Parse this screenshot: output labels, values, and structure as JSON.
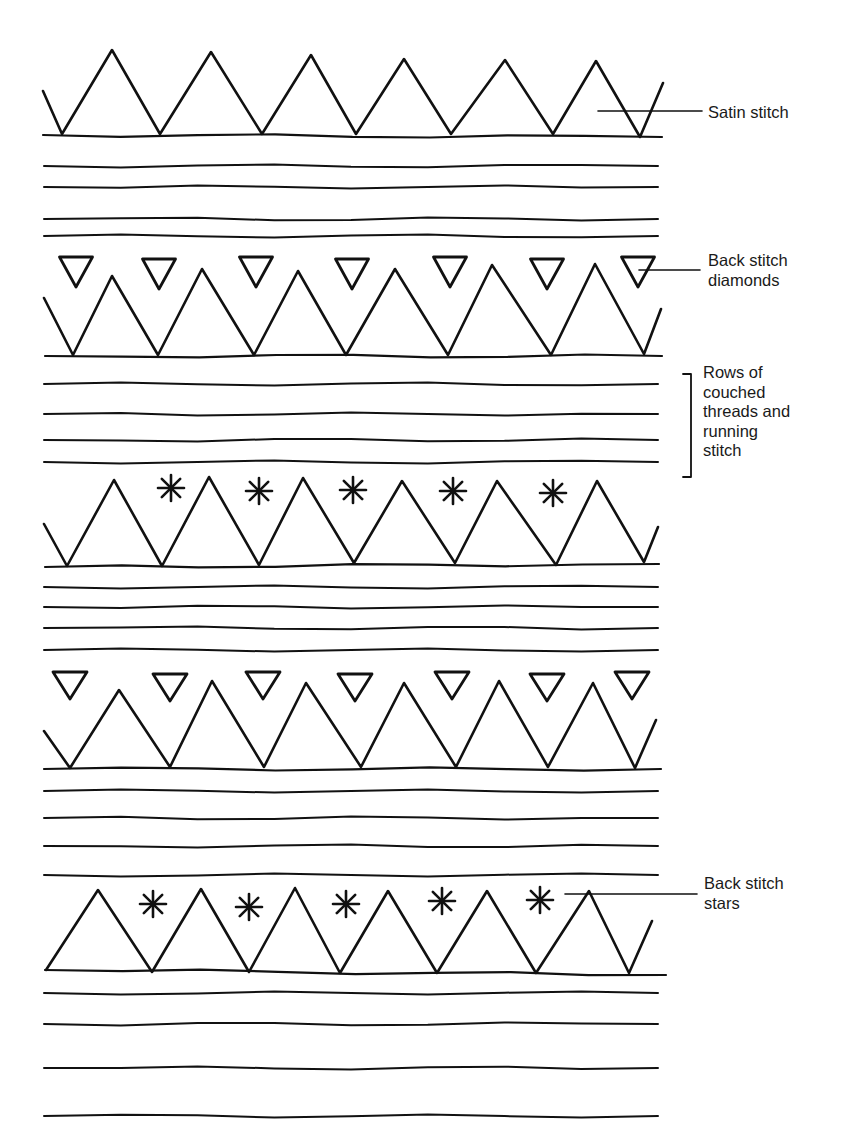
{
  "diagram": {
    "kind": "embroidery-stitch-pattern",
    "colors": {
      "ink": "#111111",
      "background": "#ffffff",
      "text": "#1a1a1a"
    },
    "labels": [
      {
        "id": "satin-stitch",
        "text": "Satin stitch",
        "x": 708,
        "y": 103
      },
      {
        "id": "back-stitch-diamonds",
        "text": "Back stitch\ndiamonds",
        "x": 708,
        "y": 251
      },
      {
        "id": "rows-of-couched-threads",
        "text": "Rows of\ncouched\nthreads and\nrunning\nstitch",
        "x": 703,
        "y": 363
      },
      {
        "id": "back-stitch-stars",
        "text": "Back stitch\nstars",
        "x": 704,
        "y": 874
      }
    ],
    "leaders": [
      {
        "for": "satin-stitch",
        "points": [
          [
            598,
            111
          ],
          [
            702,
            111
          ]
        ]
      },
      {
        "for": "back-stitch-diamonds",
        "points": [
          [
            639,
            270
          ],
          [
            700,
            270
          ]
        ]
      },
      {
        "for": "back-stitch-stars",
        "points": [
          [
            565,
            894
          ],
          [
            697,
            894
          ]
        ]
      }
    ],
    "bracket": {
      "for": "rows-of-couched-threads",
      "x": 691,
      "top": 374,
      "bottom": 477,
      "tick": 8
    },
    "zigzag_rows": [
      {
        "id": "zigzag-1",
        "baseline": [
          [
            43,
            135
          ],
          [
            662,
            137
          ]
        ],
        "points": [
          [
            43,
            91
          ],
          [
            62,
            134
          ],
          [
            112,
            50
          ],
          [
            160,
            134
          ],
          [
            211,
            52
          ],
          [
            262,
            134
          ],
          [
            311,
            55
          ],
          [
            356,
            134
          ],
          [
            404,
            59
          ],
          [
            451,
            134
          ],
          [
            505,
            60
          ],
          [
            553,
            134
          ],
          [
            596,
            61
          ],
          [
            640,
            137
          ],
          [
            663,
            83
          ]
        ]
      },
      {
        "id": "zigzag-2",
        "baseline": [
          [
            45,
            356
          ],
          [
            662,
            356
          ]
        ],
        "points": [
          [
            44,
            298
          ],
          [
            73,
            355
          ],
          [
            112,
            276
          ],
          [
            158,
            355
          ],
          [
            202,
            269
          ],
          [
            254,
            355
          ],
          [
            298,
            271
          ],
          [
            346,
            355
          ],
          [
            395,
            269
          ],
          [
            448,
            355
          ],
          [
            492,
            265
          ],
          [
            551,
            355
          ],
          [
            595,
            264
          ],
          [
            644,
            354
          ],
          [
            661,
            309
          ]
        ]
      },
      {
        "id": "zigzag-3",
        "baseline": [
          [
            45,
            567
          ],
          [
            659,
            564
          ]
        ],
        "points": [
          [
            44,
            524
          ],
          [
            67,
            566
          ],
          [
            114,
            480
          ],
          [
            162,
            566
          ],
          [
            209,
            477
          ],
          [
            259,
            565
          ],
          [
            303,
            478
          ],
          [
            354,
            563
          ],
          [
            402,
            481
          ],
          [
            455,
            563
          ],
          [
            497,
            481
          ],
          [
            556,
            565
          ],
          [
            597,
            481
          ],
          [
            644,
            562
          ],
          [
            658,
            527
          ]
        ]
      },
      {
        "id": "zigzag-4",
        "baseline": [
          [
            44,
            769
          ],
          [
            661,
            769
          ]
        ],
        "points": [
          [
            44,
            731
          ],
          [
            70,
            768
          ],
          [
            119,
            690
          ],
          [
            170,
            767
          ],
          [
            212,
            681
          ],
          [
            264,
            767
          ],
          [
            306,
            683
          ],
          [
            361,
            767
          ],
          [
            404,
            683
          ],
          [
            456,
            767
          ],
          [
            499,
            681
          ],
          [
            548,
            767
          ],
          [
            593,
            683
          ],
          [
            635,
            768
          ],
          [
            656,
            720
          ]
        ]
      },
      {
        "id": "zigzag-5",
        "baseline": [
          [
            45,
            970
          ],
          [
            666,
            975
          ]
        ],
        "points": [
          [
            46,
            970
          ],
          [
            98,
            890
          ],
          [
            152,
            972
          ],
          [
            201,
            889
          ],
          [
            249,
            972
          ],
          [
            295,
            888
          ],
          [
            340,
            973
          ],
          [
            388,
            891
          ],
          [
            437,
            973
          ],
          [
            487,
            891
          ],
          [
            536,
            973
          ],
          [
            589,
            891
          ],
          [
            629,
            973
          ],
          [
            652,
            921
          ]
        ]
      }
    ],
    "triangle_rows": [
      {
        "id": "diamonds-row-1",
        "size": {
          "w": 33,
          "h": 30
        },
        "centers_x": [
          76,
          159,
          256,
          352,
          450,
          547,
          638
        ],
        "top_y": 258
      },
      {
        "id": "diamonds-row-2",
        "size": {
          "w": 34,
          "h": 27
        },
        "centers_x": [
          70,
          170,
          263,
          355,
          452,
          547,
          632
        ],
        "top_y": 673
      }
    ],
    "star_rows": [
      {
        "id": "stars-row-1",
        "radius": 13,
        "centers": [
          [
            171,
            488
          ],
          [
            259,
            491
          ],
          [
            353,
            490
          ],
          [
            453,
            491
          ],
          [
            553,
            493
          ]
        ]
      },
      {
        "id": "stars-row-2",
        "radius": 13,
        "centers": [
          [
            153,
            904
          ],
          [
            249,
            907
          ],
          [
            346,
            904
          ],
          [
            442,
            901
          ],
          [
            540,
            900
          ]
        ]
      }
    ],
    "running_lines": [
      {
        "id": "band-1",
        "ys": [
          166,
          187,
          219,
          236
        ]
      },
      {
        "id": "band-2",
        "ys": [
          384,
          414,
          440,
          462
        ]
      },
      {
        "id": "band-3",
        "ys": [
          587,
          607,
          628,
          650
        ]
      },
      {
        "id": "band-4",
        "ys": [
          791,
          818,
          846,
          875
        ]
      },
      {
        "id": "band-5",
        "ys": [
          993,
          1024,
          1068,
          1116
        ]
      }
    ],
    "line_span": {
      "x1": 44,
      "x2": 664
    }
  }
}
